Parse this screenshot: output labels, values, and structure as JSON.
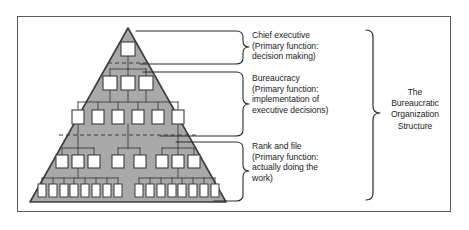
{
  "figure": {
    "kind": "pyramid-hierarchy-diagram",
    "title": "The Bureaucratic Organization Structure"
  },
  "frame": {
    "border_color": "#5a5a5a"
  },
  "pyramid": {
    "fill_color": "#a9a9a9",
    "outline_color": "#3c3c3c",
    "box_fill_color": "#ffffff",
    "box_outline_color": "#3c3c3c",
    "divider_style": "dashed",
    "apex": {
      "x": 128,
      "y": 28
    },
    "base_left": {
      "x": 30,
      "y": 202
    },
    "base_right": {
      "x": 226,
      "y": 202
    },
    "levels": [
      {
        "name": "level-1",
        "tier": "chief-executive",
        "box_count": 1,
        "groups": [
          1
        ]
      },
      {
        "name": "level-2",
        "tier": "bureaucracy",
        "box_count": 3,
        "groups": [
          3
        ]
      },
      {
        "name": "level-3",
        "tier": "bureaucracy",
        "box_count": 6,
        "groups": [
          6
        ]
      },
      {
        "name": "level-4",
        "tier": "rank-and-file",
        "box_count": 8,
        "groups": [
          3,
          2,
          3
        ]
      },
      {
        "name": "level-5",
        "tier": "rank-and-file",
        "box_count": 16,
        "groups": [
          8,
          8
        ]
      }
    ],
    "dividers": [
      {
        "name": "divider-chief-bureaucracy",
        "y": 63
      },
      {
        "name": "divider-bureaucracy-rank",
        "y": 135
      }
    ]
  },
  "labels": {
    "chief_executive": "Chief executive\n(Primary function:\ndecision making)",
    "bureaucracy": "Bureaucracy\n(Primary function:\nimplementation of\nexecutive decisions)",
    "rank_and_file": "Rank and file\n(Primary function:\nactually doing the\nwork)",
    "overall_title": "The\nBureaucratic\nOrganization\nStructure"
  },
  "brackets": [
    {
      "name": "bracket-chief-executive",
      "points_to": "chief_executive"
    },
    {
      "name": "bracket-bureaucracy",
      "points_to": "bureaucracy"
    },
    {
      "name": "bracket-rank-and-file",
      "points_to": "rank_and_file"
    },
    {
      "name": "bracket-overall",
      "points_to": "overall_title"
    }
  ]
}
